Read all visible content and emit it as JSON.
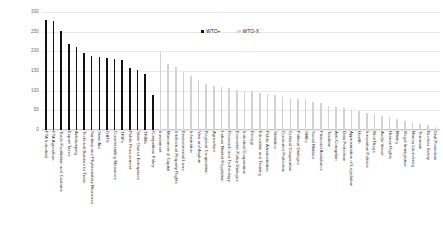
{
  "chart_data": {
    "type": "bar",
    "title": "",
    "xlabel": "",
    "ylabel": "",
    "ylim": [
      0,
      300
    ],
    "yticks": [
      0,
      50,
      100,
      150,
      200,
      250,
      300
    ],
    "grid": true,
    "legend_position": "top-center",
    "colors": {
      "WTO+": "#111111",
      "WTO-X": "#d2d2d2"
    },
    "legend": [
      "WTO+",
      "WTO-X"
    ],
    "categories": [
      "FTA Industrial",
      "FTA Agriculture",
      "Trade Facilitation and Customs",
      "Export Taxes",
      "Antidumping",
      "Technical Barriers to Trade",
      "Sanitary and Phytosanitary Measures",
      "State Aid",
      "GATS",
      "Countervailing Measures",
      "TRIPs",
      "Public Procurement",
      "State Owned Enterprises",
      "TRIMs",
      "Competition Policy",
      "Investment",
      "Movement of Capital",
      "Intellectual Property Rights",
      "Environmental Laws",
      "Information",
      "Visa and Asylum",
      "Regional Cooperation",
      "Agriculture",
      "Labour Market Regulation",
      "Research and Technology",
      "Economic Policy Dialogue",
      "Industrial Cooperation",
      "Energy",
      "Education and Training",
      "Public Administration",
      "Statistics",
      "Consumer Protection",
      "Cultural Cooperation",
      "Political Dialogue",
      "SMEs",
      "Social Matters",
      "Financial Assistance",
      "Taxation",
      "Anti-Corruption",
      "Data Protection",
      "Approximation of Legislation",
      "Health",
      "Innovation Policies",
      "Illicit Drugs",
      "Audio Visual",
      "Human Rights",
      "Mining",
      "Illegal Immigration",
      "Money Laundering",
      "Terrorism",
      "Nuclear Safety",
      "Civil Protection"
    ],
    "series": [
      {
        "name": "WTO+",
        "values": [
          280,
          278,
          252,
          218,
          210,
          196,
          187,
          185,
          183,
          181,
          178,
          157,
          153,
          143,
          88,
          null,
          null,
          null,
          null,
          null,
          null,
          null,
          null,
          null,
          null,
          null,
          null,
          null,
          null,
          null,
          null,
          null,
          null,
          null,
          null,
          null,
          null,
          null,
          null,
          null,
          null,
          null,
          null,
          null,
          null,
          null,
          null,
          null,
          null,
          null,
          null,
          null
        ]
      },
      {
        "name": "WTO-X",
        "values": [
          null,
          null,
          null,
          null,
          null,
          null,
          null,
          null,
          null,
          null,
          null,
          null,
          null,
          null,
          null,
          200,
          167,
          160,
          148,
          138,
          126,
          118,
          112,
          110,
          108,
          103,
          100,
          98,
          95,
          92,
          88,
          85,
          82,
          80,
          78,
          72,
          68,
          62,
          58,
          55,
          52,
          48,
          44,
          40,
          36,
          32,
          28,
          24,
          20,
          16,
          12,
          8
        ]
      }
    ]
  }
}
